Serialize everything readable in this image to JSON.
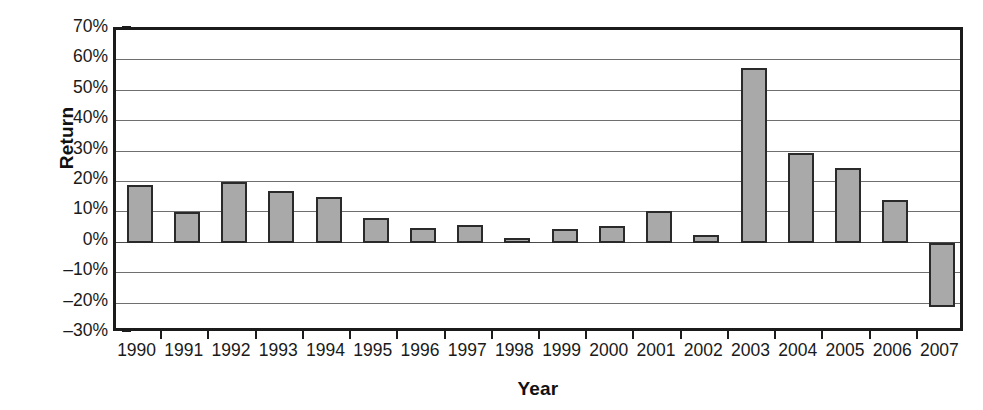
{
  "chart_data": {
    "type": "bar",
    "title": "",
    "xlabel": "Year",
    "ylabel": "Return",
    "categories": [
      "1990",
      "1991",
      "1992",
      "1993",
      "1994",
      "1995",
      "1996",
      "1997",
      "1998",
      "1999",
      "2000",
      "2001",
      "2002",
      "2003",
      "2004",
      "2005",
      "2006",
      "2007"
    ],
    "values": [
      19,
      10,
      20,
      17,
      15,
      8,
      5,
      6,
      1.5,
      4.5,
      5.5,
      10.5,
      2.5,
      57.5,
      29.5,
      24.5,
      14,
      -21
    ],
    "value_unit": "percent",
    "ylim": [
      -30,
      70
    ],
    "ytick_values": [
      70,
      60,
      50,
      40,
      30,
      20,
      10,
      0,
      -10,
      -20,
      -30
    ],
    "ytick_labels": [
      "70%",
      "60%",
      "50%",
      "40%",
      "30%",
      "20%",
      "10%",
      "0%",
      "–10%",
      "–20%",
      "–30%"
    ],
    "grid": true,
    "legend": false,
    "legend_position": "none",
    "series": [
      {
        "name": "Return",
        "values": [
          19,
          10,
          20,
          17,
          15,
          8,
          5,
          6,
          1.5,
          4.5,
          5.5,
          10.5,
          2.5,
          57.5,
          29.5,
          24.5,
          14,
          -21
        ]
      }
    ],
    "colors": {
      "bar_fill": "#a9a9a9",
      "bar_stroke": "#2a2a2a",
      "gridline": "#6f6f6f",
      "axis": "#1b1b1b",
      "background": "#ffffff",
      "text": "#1a1a1a"
    }
  }
}
